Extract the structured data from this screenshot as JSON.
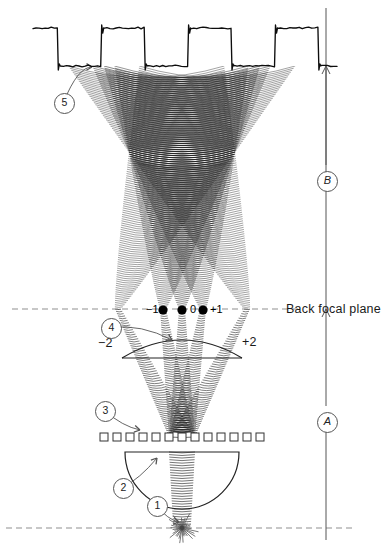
{
  "figure": {
    "optical_axis_x": 182,
    "colors": {
      "ink": "#111111",
      "line": "#333333",
      "dash": "#8a8a8a",
      "callout_ring": "#555555"
    }
  },
  "annotations": {
    "back_focal_plane_label": "Back focal plane",
    "callouts": [
      {
        "id": "1",
        "label": "1",
        "x": 147,
        "y": 496,
        "target_x": 179,
        "target_y": 522,
        "desc": "light-source"
      },
      {
        "id": "2",
        "label": "2",
        "x": 113,
        "y": 478,
        "target_x": 157,
        "target_y": 458,
        "desc": "condenser-lens"
      },
      {
        "id": "3",
        "label": "3",
        "x": 95,
        "y": 401,
        "target_x": 140,
        "target_y": 430,
        "desc": "specimen-grating"
      },
      {
        "id": "4",
        "label": "4",
        "x": 101,
        "y": 318,
        "target_x": 172,
        "target_y": 340,
        "desc": "objective-lens"
      },
      {
        "id": "5",
        "label": "5",
        "x": 54,
        "y": 93,
        "target_x": 92,
        "target_y": 67,
        "desc": "intensity-trace"
      }
    ],
    "dimension_markers": [
      {
        "id": "B",
        "label": "B",
        "x": 317,
        "y": 171,
        "desc": "image-distance"
      },
      {
        "id": "A",
        "label": "A",
        "x": 317,
        "y": 412,
        "desc": "object-distance"
      }
    ],
    "diffraction_orders": [
      {
        "label": "−1",
        "x": 148,
        "y": 304,
        "dot": true,
        "dot_x": 163,
        "dot_y": 310
      },
      {
        "label": "0",
        "x": 191,
        "y": 304,
        "dot": true,
        "dot_x": 182,
        "dot_y": 310
      },
      {
        "label": "+1",
        "x": 211,
        "y": 304,
        "dot": true,
        "dot_x": 203,
        "dot_y": 310
      }
    ],
    "outer_orders": [
      {
        "label": "−2",
        "x": 99,
        "y": 337
      },
      {
        "label": "+2",
        "x": 243,
        "y": 336
      }
    ]
  },
  "geometry": {
    "back_focal_plane_y": 309,
    "specimen_plane_y": 437,
    "source_plane_y": 528,
    "objective_lens": {
      "cx": 182,
      "cy": 349,
      "half_width": 60,
      "sagitta": 18
    },
    "condenser_lens": {
      "cx": 182,
      "cy": 452,
      "radius": 57
    },
    "grating": {
      "count": 13,
      "size": 8,
      "spacing": 13,
      "y": 433
    },
    "order_beams": [
      {
        "order": "−2",
        "focus_x": 118,
        "spread": 22
      },
      {
        "order": "−1",
        "focus_x": 163,
        "spread": 16
      },
      {
        "order": "0",
        "focus_x": 182,
        "spread": 14
      },
      {
        "order": "+1",
        "focus_x": 203,
        "spread": 16
      },
      {
        "order": "+2",
        "focus_x": 247,
        "spread": 22
      }
    ]
  },
  "trace": {
    "name": "square-wave-intensity-profile",
    "baseline_y": 66,
    "peak_y": 28,
    "x_start": 33,
    "x_end": 337,
    "cycles": 3.5,
    "noise": true
  }
}
